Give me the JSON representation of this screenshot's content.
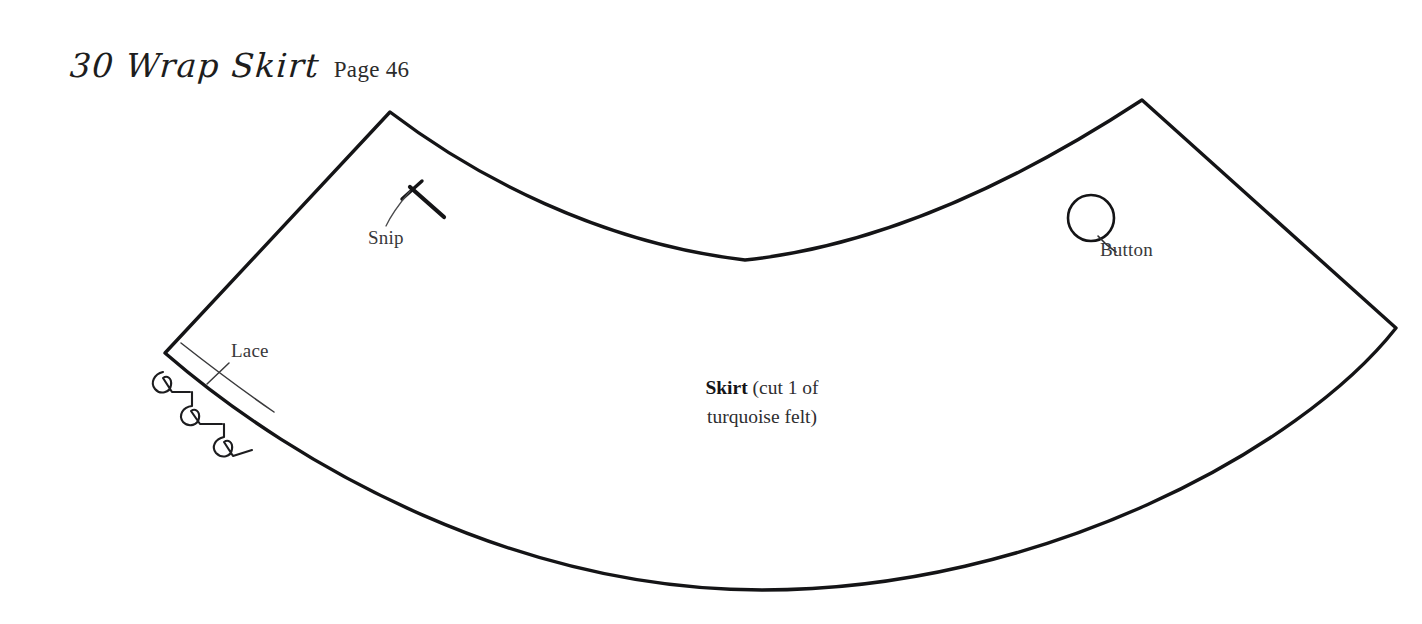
{
  "page": {
    "background_color": "#ffffff",
    "ink_color": "#141416",
    "label_color": "#38383a"
  },
  "header": {
    "pattern_number_and_name": "30 Wrap Skirt",
    "page_reference": "Page 46"
  },
  "pattern_piece": {
    "name": "Skirt",
    "cut_instruction": "(cut 1 of",
    "cut_instruction_line2": "turquoise felt)",
    "full_text": "Skirt (cut 1 of turquoise felt)"
  },
  "markings": [
    {
      "id": "snip",
      "label": "Snip",
      "type": "notch-mark",
      "description": "short perpendicular tick crossing a bold diagonal stroke"
    },
    {
      "id": "lace",
      "label": "Lace",
      "type": "trim-placement-line",
      "description": "curved guide line parallel to left edge with crossing tick and scalloped lace trim"
    },
    {
      "id": "button",
      "label": "Button",
      "type": "button-placement-circle",
      "description": "open circle indicating button position"
    }
  ],
  "icons": {
    "snip_mark": "snip-notch-icon",
    "lace_trim": "lace-scallop-icon",
    "button_circle": "button-circle-icon"
  }
}
